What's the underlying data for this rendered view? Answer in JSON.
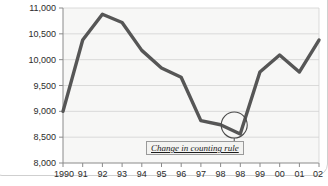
{
  "chart_data": {
    "type": "line",
    "title": "",
    "subtitle": "",
    "xlabel": "",
    "ylabel": "",
    "grid": true,
    "legend_position": "none",
    "ylim": [
      8000,
      11000
    ],
    "ytick_labels": [
      "11,000",
      "10,500",
      "10,000",
      "9,500",
      "9,000",
      "8,500",
      "8,000"
    ],
    "ytick_values": [
      11000,
      10500,
      10000,
      9500,
      9000,
      8500,
      8000
    ],
    "xtick_labels": [
      "1990",
      "91",
      "92",
      "93",
      "94",
      "95",
      "96",
      "97",
      "98",
      "98",
      "99",
      "00",
      "01",
      "02"
    ],
    "categories": [
      "1990",
      "91",
      "92",
      "93",
      "94",
      "95",
      "96",
      "97",
      "98",
      "98",
      "99",
      "00",
      "01",
      "02"
    ],
    "series": [
      {
        "name": "count",
        "values": [
          9000,
          10380,
          10880,
          10720,
          10180,
          9840,
          9660,
          8820,
          8740,
          8560,
          9760,
          10090,
          9760,
          10380
        ]
      }
    ],
    "annotations": [
      {
        "name": "change-in-counting-rule",
        "text": "Change in counting rule",
        "marker": "circle",
        "points_to_category": "98"
      }
    ],
    "colors": {
      "line": "#565656",
      "plot_background": "#f7f7f6",
      "gridline": "#d2d2d2",
      "axis": "#8a8a8a",
      "text": "#2b2b2b",
      "annotation_border": "#9a9a9a",
      "annotation_background": "#f3f3f1"
    }
  },
  "annotation": {
    "label": "Change in counting rule"
  },
  "axes": {
    "y": {
      "ticks": [
        {
          "label": "11,000"
        },
        {
          "label": "10,500"
        },
        {
          "label": "10,000"
        },
        {
          "label": "9,500"
        },
        {
          "label": "9,000"
        },
        {
          "label": "8,500"
        },
        {
          "label": "8,000"
        }
      ]
    },
    "x": {
      "ticks": [
        {
          "label": "1990"
        },
        {
          "label": "91"
        },
        {
          "label": "92"
        },
        {
          "label": "93"
        },
        {
          "label": "94"
        },
        {
          "label": "95"
        },
        {
          "label": "96"
        },
        {
          "label": "97"
        },
        {
          "label": "98"
        },
        {
          "label": "98"
        },
        {
          "label": "99"
        },
        {
          "label": "00"
        },
        {
          "label": "01"
        },
        {
          "label": "02"
        }
      ]
    }
  }
}
